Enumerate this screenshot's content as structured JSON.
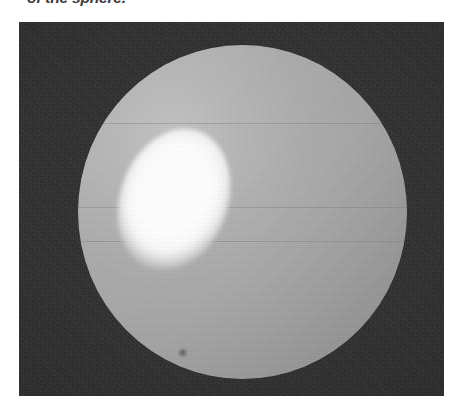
{
  "page": {
    "background_color": "#ffffff",
    "width": 470,
    "height": 414
  },
  "caption": {
    "clipped_tail_text": "of the sphere."
  },
  "figure": {
    "name": "sphere-photograph",
    "panel": {
      "background_color": "#2b2b2b",
      "x": 19,
      "y": 22,
      "width": 425,
      "height": 374
    },
    "sphere": {
      "label": "sphere",
      "body_color": "#a8a8a8",
      "light_side_color": "#bcbcbc",
      "shadow_side_color": "#949494",
      "center_x": 242,
      "center_y": 211,
      "radius": 164
    },
    "highlight": {
      "label": "specular-highlight",
      "color": "#ffffff",
      "center_x": 142,
      "center_y": 172,
      "radius_x": 52,
      "radius_y": 70,
      "rotation_degrees": 20
    },
    "blemish": {
      "label": "surface-blemish",
      "color": "#4a4a4a",
      "center_x": 182,
      "center_y": 352,
      "radius": 4
    }
  }
}
